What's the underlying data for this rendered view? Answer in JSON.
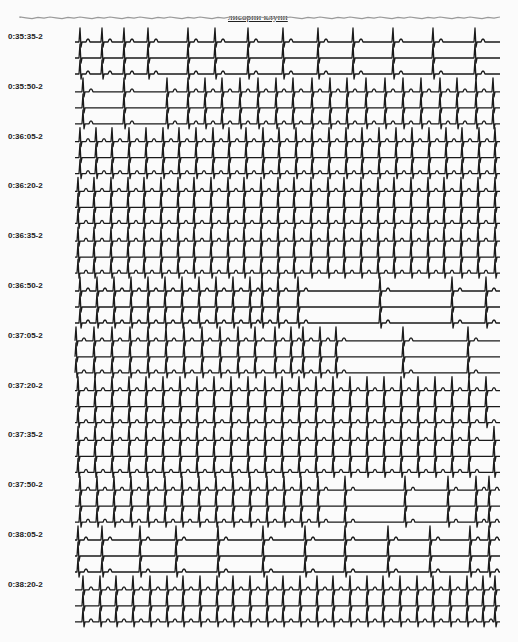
{
  "document": {
    "caption": "лисорпи клупп",
    "lead_suffix": "-2"
  },
  "strip_layout": {
    "trace_x_start": 75,
    "trace_x_end": 500,
    "traces_per_group": 3,
    "trace_spacing": 16,
    "first_trace_y": 42,
    "group_spacing": 49.8,
    "ink_color": "#1a1a1a",
    "noise_color": "#9a9a9a"
  },
  "groups": [
    {
      "label": "0:35:35-2",
      "beats": [
        80,
        102,
        124,
        148,
        188,
        215,
        248,
        283,
        318,
        353,
        393,
        433,
        475
      ]
    },
    {
      "label": "0:35:50-2",
      "beats": [
        83,
        124,
        167,
        188,
        205,
        222,
        240,
        258,
        276,
        293,
        312,
        330,
        347,
        366,
        385,
        403,
        421,
        440,
        457,
        476,
        493
      ]
    },
    {
      "label": "0:36:05-2",
      "beats": [
        80,
        96,
        112,
        129,
        146,
        163,
        179,
        196,
        213,
        229,
        246,
        263,
        279,
        296,
        312,
        329,
        346,
        362,
        379,
        396,
        412,
        429,
        446,
        462,
        479,
        495
      ]
    },
    {
      "label": "0:36:20-2",
      "beats": [
        78,
        94,
        111,
        128,
        144,
        161,
        178,
        194,
        211,
        228,
        244,
        261,
        278,
        294,
        311,
        328,
        344,
        361,
        378,
        394,
        411,
        428,
        444,
        461,
        478,
        495
      ]
    },
    {
      "label": "0:36:35-2",
      "beats": [
        78,
        94,
        111,
        128,
        144,
        161,
        178,
        194,
        211,
        228,
        244,
        261,
        278,
        294,
        311,
        328,
        344,
        361,
        378,
        394,
        411,
        428,
        444,
        461,
        478,
        495
      ]
    },
    {
      "label": "0:36:50-2",
      "beats": [
        80,
        97,
        114,
        131,
        148,
        165,
        182,
        199,
        216,
        233,
        250,
        262,
        278,
        298,
        380,
        452,
        486
      ]
    },
    {
      "label": "0:37:05-2",
      "beats": [
        76,
        94,
        112,
        130,
        148,
        166,
        184,
        202,
        220,
        238,
        255,
        275,
        291,
        303,
        320,
        336,
        403,
        468
      ]
    },
    {
      "label": "0:37:20-2",
      "beats": [
        78,
        95,
        112,
        129,
        146,
        163,
        180,
        197,
        214,
        231,
        248,
        265,
        282,
        299,
        316,
        333,
        350,
        367,
        384,
        401,
        418,
        435,
        452,
        469,
        486
      ]
    },
    {
      "label": "0:37:35-2",
      "beats": [
        78,
        95,
        112,
        129,
        146,
        163,
        180,
        197,
        214,
        231,
        248,
        265,
        282,
        299,
        316,
        333,
        350,
        367,
        384,
        401,
        418,
        435,
        452,
        469,
        494
      ]
    },
    {
      "label": "0:37:50-2",
      "beats": [
        80,
        97,
        114,
        131,
        148,
        165,
        182,
        199,
        216,
        233,
        250,
        267,
        284,
        301,
        318,
        345,
        405,
        448,
        476,
        489
      ]
    },
    {
      "label": "0:38:05-2",
      "beats": [
        78,
        102,
        140,
        176,
        218,
        263,
        305,
        345,
        388,
        430,
        470,
        489
      ]
    },
    {
      "label": "0:38:20-2",
      "beats": [
        83,
        100,
        116,
        133,
        150,
        167,
        183,
        200,
        217,
        233,
        250,
        267,
        283,
        300,
        317,
        333,
        350,
        367,
        383,
        400,
        417,
        433,
        450,
        467,
        483,
        495
      ]
    }
  ]
}
